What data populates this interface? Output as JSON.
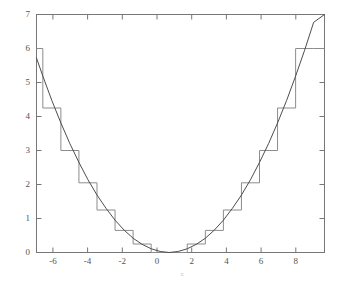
{
  "chart_data": {
    "type": "line",
    "title": "",
    "xlabel": "x",
    "ylabel": "",
    "xlim": [
      -7.35,
      8.6
    ],
    "ylim": [
      0,
      7
    ],
    "grid": false,
    "legend": null,
    "xticks": [
      -6,
      -4,
      -2,
      0,
      2,
      4,
      6,
      8
    ],
    "xtick_labels": [
      "-6",
      "-4",
      "-2",
      "0",
      "2",
      "4",
      "6",
      "8"
    ],
    "yticks": [
      0,
      1,
      2,
      3,
      4,
      5,
      6,
      7
    ],
    "ytick_labels": [
      "0",
      "1",
      "2",
      "3",
      "4",
      "5",
      "6",
      "7"
    ],
    "series": [
      {
        "name": "smooth parabola",
        "type": "line",
        "style": "solid",
        "color": "#4d4d4d",
        "formula": "y = x^2 / 9.45",
        "x": [
          -7.35,
          -7.0,
          -6.5,
          -6.0,
          -5.5,
          -5.0,
          -4.5,
          -4.0,
          -3.5,
          -3.0,
          -2.5,
          -2.0,
          -1.5,
          -1.0,
          -0.5,
          0.0,
          0.5,
          1.0,
          1.5,
          2.0,
          2.5,
          3.0,
          3.5,
          4.0,
          4.5,
          5.0,
          5.5,
          6.0,
          6.5,
          7.0,
          7.5,
          8.0,
          8.6
        ],
        "y": [
          5.72,
          5.19,
          4.47,
          3.81,
          3.2,
          2.65,
          2.14,
          1.69,
          1.3,
          0.95,
          0.66,
          0.42,
          0.24,
          0.11,
          0.03,
          0.0,
          0.03,
          0.11,
          0.24,
          0.42,
          0.66,
          0.95,
          1.3,
          1.69,
          2.14,
          2.65,
          3.2,
          3.81,
          4.47,
          5.19,
          5.95,
          6.77,
          7.0
        ]
      },
      {
        "name": "quantized staircase",
        "type": "step",
        "style": "solid",
        "color": "#8c8c8c",
        "step_edges": [
          -7.35,
          -7.0,
          -6.0,
          -5.0,
          -4.0,
          -3.0,
          -2.0,
          -1.0,
          1.0,
          2.0,
          3.0,
          4.0,
          5.0,
          6.0,
          7.0,
          8.0,
          8.6
        ],
        "step_values": [
          6.0,
          4.25,
          3.0,
          2.05,
          1.25,
          0.65,
          0.25,
          0.0,
          0.25,
          0.65,
          1.25,
          2.05,
          3.0,
          4.25,
          6.0,
          6.0
        ]
      }
    ]
  },
  "axes": {
    "x_title": "x",
    "frame_color": "#777777"
  }
}
